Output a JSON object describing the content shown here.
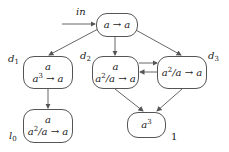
{
  "diagram": {
    "entry_label": "in",
    "nodes": {
      "root": {
        "line1": "",
        "rule": "a → a"
      },
      "d1": {
        "label": "d",
        "label_sub": "1",
        "line1": "a",
        "rule_base": "a",
        "rule_exp": "3",
        "rule_rest": " → a"
      },
      "d2": {
        "label": "d",
        "label_sub": "2",
        "line1": "a",
        "rule_base": "a",
        "rule_exp": "2",
        "rule_rest": "/a → a"
      },
      "d3": {
        "label": "d",
        "label_sub": "3",
        "rule_base": "a",
        "rule_exp": "2",
        "rule_rest": "/a → a"
      },
      "l0": {
        "label": "l",
        "label_sub": "0",
        "line1": "a",
        "rule_base": "a",
        "rule_exp": "2",
        "rule_rest": "/a → a"
      },
      "final": {
        "base": "a",
        "exp": "3",
        "tag": "1"
      }
    },
    "edges": [
      [
        "in",
        "root"
      ],
      [
        "root",
        "d1"
      ],
      [
        "root",
        "d2"
      ],
      [
        "root",
        "d3"
      ],
      [
        "d1",
        "l0"
      ],
      [
        "d2",
        "d3"
      ],
      [
        "d3",
        "d2"
      ],
      [
        "d2",
        "final"
      ],
      [
        "d3",
        "final"
      ]
    ],
    "colors": {
      "stroke": "#555555",
      "text": "#222222"
    }
  }
}
